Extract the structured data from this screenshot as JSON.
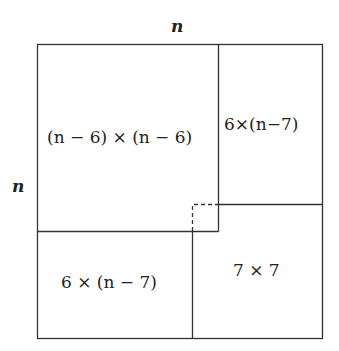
{
  "diagram": {
    "top_label": "n",
    "left_label": "n",
    "regions": [
      {
        "id": "top-left",
        "label": "(n − 6) × (n − 6)"
      },
      {
        "id": "top-right",
        "label": "6×(n−7)"
      },
      {
        "id": "bottom-left",
        "label": "6 × (n − 7)"
      },
      {
        "id": "bottom-right",
        "label": "7 × 7"
      }
    ],
    "colors": {
      "line": "#333333",
      "background": "#ffffff"
    }
  }
}
